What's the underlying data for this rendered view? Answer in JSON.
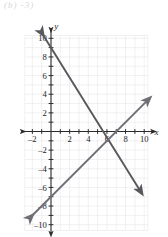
{
  "figure": {
    "top_fragment": "(b)   -3)",
    "axis_labels": {
      "x": "x",
      "y": "y"
    },
    "x_tick_labels": [
      "-2",
      "2",
      "4",
      "6",
      "8",
      "10"
    ],
    "y_tick_labels": [
      "10",
      "8",
      "6",
      "4",
      "2",
      "-2",
      "-4",
      "-6",
      "-8",
      "-10"
    ],
    "colors": {
      "line_descending": "#57575c",
      "line_ascending": "#6e6e74",
      "axis": "#2b2b2b",
      "grid": "#e2e2e6",
      "background": "#ffffff"
    }
  },
  "chart_data": {
    "type": "line",
    "title": "",
    "xlabel": "x",
    "ylabel": "y",
    "xlim": [
      -3,
      11
    ],
    "ylim": [
      -11,
      10.5
    ],
    "grid": true,
    "legend": "none",
    "x_ticks": [
      -2,
      2,
      4,
      6,
      8,
      10
    ],
    "y_ticks": [
      10,
      8,
      6,
      4,
      2,
      -2,
      -4,
      -6,
      -8,
      -10
    ],
    "series": [
      {
        "name": "descending-line",
        "slope": -1.6,
        "intercept": 9,
        "x_intercept": 5.6,
        "y_intercept": 9,
        "points": [
          [
            -1,
            10.6
          ],
          [
            0,
            9
          ],
          [
            5.6,
            0
          ],
          [
            9.6,
            -6.4
          ]
        ],
        "arrows": [
          "start",
          "end"
        ],
        "color": "#57575c"
      },
      {
        "name": "ascending-line",
        "slope": 1.0,
        "intercept": -7,
        "x_intercept": 7,
        "y_intercept": -7,
        "points": [
          [
            -2.2,
            -9.2
          ],
          [
            0,
            -7
          ],
          [
            7,
            0
          ],
          [
            10.4,
            3.4
          ]
        ],
        "arrows": [
          "start",
          "end"
        ],
        "color": "#6e6e74"
      }
    ],
    "intersection": [
      6,
      -1
    ],
    "annotations": []
  }
}
